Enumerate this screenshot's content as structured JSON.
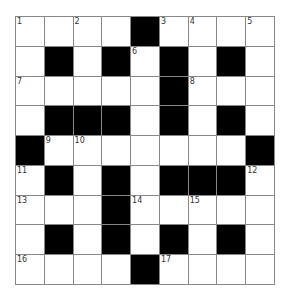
{
  "puzzle": {
    "rows": 9,
    "cols": 9,
    "colors": {
      "black": "#000000",
      "white": "#ffffff",
      "line": "#888888"
    },
    "grid": [
      [
        "1",
        "W",
        "2",
        "W",
        "B",
        "3",
        "4",
        "W",
        "5"
      ],
      [
        "W",
        "B",
        "W",
        "B",
        "6",
        "B",
        "W",
        "B",
        "W"
      ],
      [
        "7",
        "W",
        "W",
        "W",
        "W",
        "B",
        "8",
        "W",
        "W"
      ],
      [
        "W",
        "B",
        "B",
        "B",
        "W",
        "B",
        "W",
        "B",
        "W"
      ],
      [
        "B",
        "9",
        "10",
        "W",
        "W",
        "W",
        "W",
        "W",
        "B"
      ],
      [
        "11",
        "B",
        "W",
        "B",
        "W",
        "B",
        "B",
        "B",
        "12"
      ],
      [
        "13",
        "W",
        "W",
        "B",
        "14",
        "W",
        "15",
        "W",
        "W"
      ],
      [
        "W",
        "B",
        "W",
        "B",
        "W",
        "B",
        "W",
        "B",
        "W"
      ],
      [
        "16",
        "W",
        "W",
        "W",
        "B",
        "17",
        "W",
        "W",
        "W"
      ]
    ]
  }
}
